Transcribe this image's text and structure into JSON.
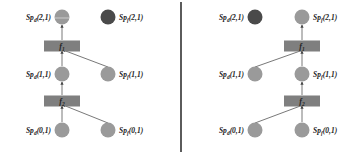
{
  "colors": {
    "node": "#9a9a9a",
    "node_dark": "#4a4a4a",
    "func_box": "#7f7f7f",
    "edge": "#555555",
    "divider": "#333333"
  },
  "panels": [
    {
      "name": "left",
      "nodes": {
        "d2": {
          "label": "Sp",
          "sub": "d",
          "coord": "(2,1)",
          "style": "split"
        },
        "f2": {
          "label": "Sp",
          "sub": "f",
          "coord": "(2,1)",
          "style": "dark"
        },
        "d1": {
          "label": "Sp",
          "sub": "d",
          "coord": "(1,1)",
          "style": "normal"
        },
        "f1": {
          "label": "Sp",
          "sub": "f",
          "coord": "(1,1)",
          "style": "normal"
        },
        "d0": {
          "label": "Sp",
          "sub": "d",
          "coord": "(0,1)",
          "style": "normal"
        },
        "f0": {
          "label": "Sp",
          "sub": "f",
          "coord": "(0,1)",
          "style": "normal"
        }
      },
      "funcs": {
        "top": {
          "label": "f",
          "sub": "1"
        },
        "bottom": {
          "label": "f",
          "sub": "2"
        }
      }
    },
    {
      "name": "right",
      "nodes": {
        "d2": {
          "label": "Sp",
          "sub": "d",
          "coord": "(2,1)",
          "style": "dark"
        },
        "f2": {
          "label": "Sp",
          "sub": "f",
          "coord": "(2,1)",
          "style": "normal"
        },
        "d1": {
          "label": "Sp",
          "sub": "d",
          "coord": "(1,1)",
          "style": "normal"
        },
        "f1": {
          "label": "Sp",
          "sub": "f",
          "coord": "(1,1)",
          "style": "normal"
        },
        "d0": {
          "label": "Sp",
          "sub": "d",
          "coord": "(0,1)",
          "style": "normal"
        },
        "f0": {
          "label": "Sp",
          "sub": "f",
          "coord": "(0,1)",
          "style": "normal"
        }
      },
      "funcs": {
        "top": {
          "label": "f",
          "sub": "1"
        },
        "bottom": {
          "label": "f",
          "sub": "2"
        }
      }
    }
  ]
}
